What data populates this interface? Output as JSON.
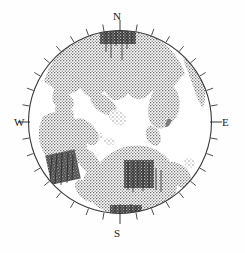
{
  "figure": {
    "width": 245,
    "height": 253,
    "background_color": "#fefefe"
  },
  "projection": {
    "type": "stereographic-hemisphere",
    "center_x": 120,
    "center_y": 122,
    "radius": 92,
    "outline_color": "#3a3a3a",
    "outline_width": 1.1
  },
  "cardinal_labels": {
    "north": "N",
    "east": "E",
    "south": "S",
    "west": "W"
  },
  "graticule": {
    "tick_interval_degrees": 10,
    "tick_count": 36,
    "tick_length": 7,
    "tick_color": "#3a3a3a",
    "tick_width": 0.9,
    "ticks_outside": true
  },
  "shading": {
    "land_fill_color": "#8d8d8d",
    "land_stipple_color": "#4a4a4a",
    "dense_patch_color": "#2e2e2e",
    "ocean_fill_color": "#ffffff",
    "pattern": "stipple"
  },
  "chart_data": {
    "type": "map",
    "projection": "stereographic",
    "axis_labels": [
      "N",
      "E",
      "S",
      "W"
    ],
    "grid": true,
    "legend": "none",
    "radius_units": "normalized",
    "land_regions": [
      {
        "name": "northern-polar-mass",
        "centroid": [
          0.03,
          0.72
        ],
        "description": "large stippled landmass spanning the northern half of the disc"
      },
      {
        "name": "north-polar-dense-patch",
        "centroid": [
          0.02,
          0.94
        ],
        "description": "dark concentrated area at the north pole"
      },
      {
        "name": "eastern-peninsula",
        "centroid": [
          0.45,
          0.3
        ],
        "description": "stippled arm extending toward the east-northeast limb"
      },
      {
        "name": "east-limb-strip",
        "centroid": [
          0.82,
          0.36
        ],
        "description": "narrow stippled band along the eastern limb"
      },
      {
        "name": "central-small-island",
        "centroid": [
          0.01,
          0.2
        ],
        "description": "small isolated stippled patch near disc centre"
      },
      {
        "name": "central-islet-cluster",
        "centroid": [
          -0.16,
          0.07
        ],
        "description": "pair of tiny stippled islets west of centre"
      },
      {
        "name": "western-mass",
        "centroid": [
          -0.62,
          -0.12
        ],
        "description": "broad stippled region along the western limb"
      },
      {
        "name": "southwest-dense-patch",
        "centroid": [
          -0.55,
          -0.52
        ],
        "description": "dark concentrated area in the southwest quadrant"
      },
      {
        "name": "southern-mass",
        "centroid": [
          0.12,
          -0.5
        ],
        "description": "large stippled landmass across the southern half"
      },
      {
        "name": "south-central-dense-patch",
        "centroid": [
          0.06,
          -0.45
        ],
        "description": "dark concentrated area south of centre"
      },
      {
        "name": "south-limb-dense-patch",
        "centroid": [
          0.02,
          -0.9
        ],
        "description": "dark concentrated area at the south pole limb"
      },
      {
        "name": "southeast-patch",
        "centroid": [
          0.62,
          -0.44
        ],
        "description": "stippled patch toward the southeastern limb"
      },
      {
        "name": "east-tick-mark-islet",
        "centroid": [
          0.54,
          0.08
        ],
        "description": "tiny stippled mark east of centre"
      }
    ]
  }
}
